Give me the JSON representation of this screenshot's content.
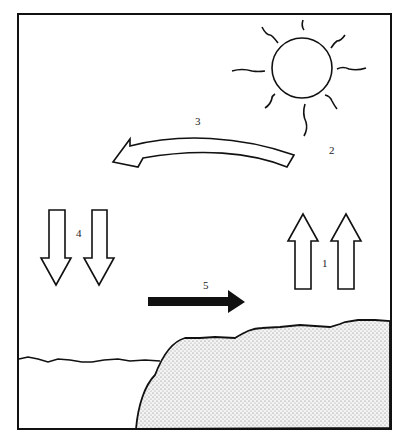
{
  "diagram": {
    "labels": {
      "one": "1",
      "two": "2",
      "three": "3",
      "four": "4",
      "five": "5"
    },
    "elements": {
      "sun": "sun-icon",
      "arrow_up": "rising-air-arrows",
      "arrow_down": "sinking-air-arrows",
      "arrow_curved": "upper-air-flow-arrow",
      "arrow_solid": "surface-wind-arrow",
      "land": "land-stippled",
      "sea": "sea-surface"
    }
  }
}
